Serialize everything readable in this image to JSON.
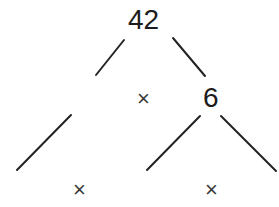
{
  "diagram": {
    "type": "factor-tree",
    "root": {
      "label": "42"
    },
    "level1": {
      "left_blank": true,
      "operator": "×",
      "right": {
        "label": "6"
      }
    },
    "level2": {
      "left_pair": {
        "operator": "×"
      },
      "right_pair": {
        "operator": "×"
      }
    },
    "colors": {
      "line": "#222222",
      "text": "#1c1c1c",
      "background": "#ffffff"
    }
  }
}
